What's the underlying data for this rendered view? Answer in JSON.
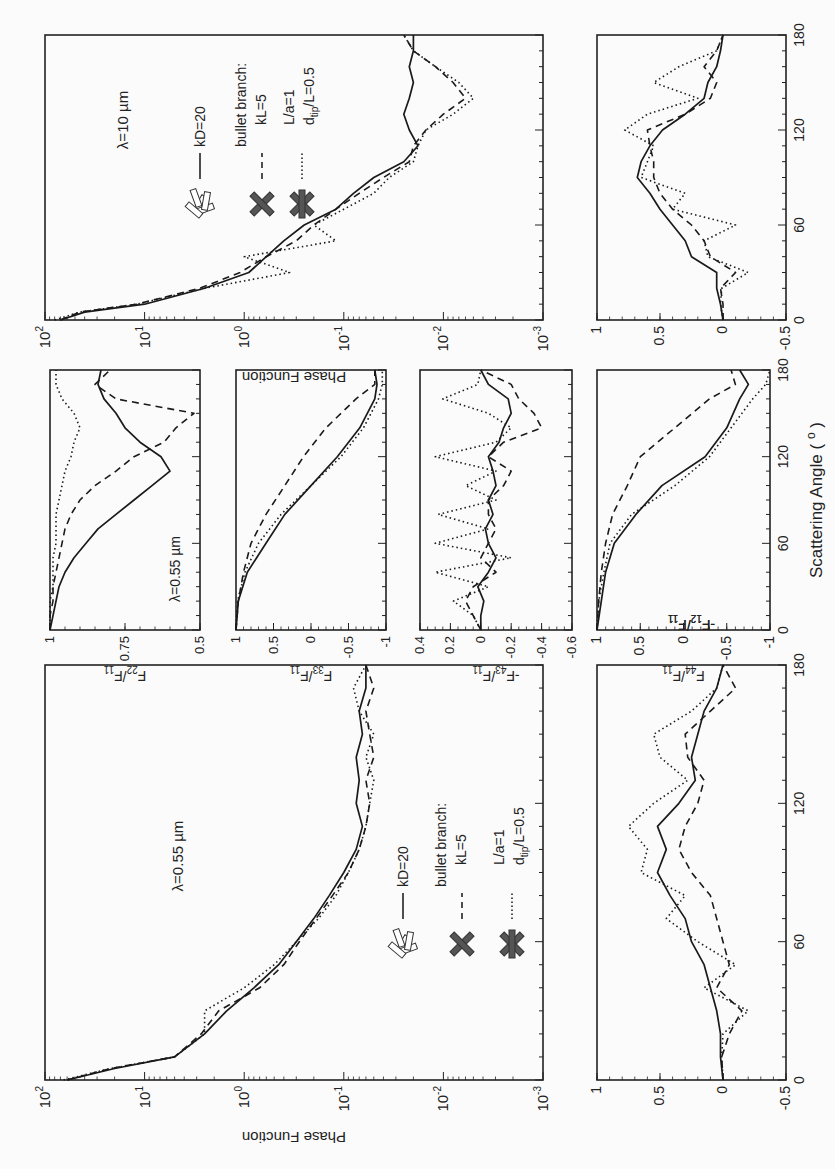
{
  "figure": {
    "orientation": "rotated-90-ccw",
    "x_axis_label": "Scattering Angle ( o )",
    "x_ticks": [
      "0",
      "60",
      "120",
      "180"
    ]
  },
  "panels": {
    "a_phase_10um": {
      "annotation": "λ=10 µm",
      "ylabel": "Phase Function",
      "yticks": [
        "10²",
        "10¹",
        "10⁰",
        "10⁻¹",
        "10⁻²",
        "10⁻³"
      ],
      "legend": {
        "solid": "kD=20",
        "header": "bullet branch:",
        "dashed": "kL=5",
        "dotted_1": "L/a=1",
        "dotted_2": "d_tip/L=0.5"
      }
    },
    "b_phase_055um": {
      "annotation": "λ=0.55 µm",
      "ylabel": "Phase Function",
      "yticks": [
        "10²",
        "10¹",
        "10⁰",
        "10⁻¹",
        "10⁻²",
        "10⁻³"
      ],
      "legend": {
        "solid": "kD=20",
        "header": "bullet branch:",
        "dashed": "kL=5",
        "dotted_1": "L/a=1",
        "dotted_2": "d_tip/L=0.5"
      }
    },
    "c_f12_10um": {
      "ylabel": "-F12/F11",
      "yticks": [
        "1",
        "0.5",
        "0",
        "-0.5"
      ]
    },
    "d_f12_055um": {
      "ylabel": "-F12/F11",
      "yticks": [
        "1",
        "0.5",
        "0",
        "-0.5"
      ]
    },
    "e_f22": {
      "annotation": "λ=0.55 µm",
      "ylabel": "F22/F11",
      "yticks": [
        "1",
        "0.75",
        "0.5"
      ]
    },
    "f_f33": {
      "ylabel": "F33/F11",
      "yticks": [
        "1",
        "0.5",
        "0",
        "-0.5",
        "-1"
      ]
    },
    "g_f43": {
      "ylabel": "-F43/F11",
      "yticks": [
        "0.4",
        "0.2",
        "0",
        "-0.2",
        "-0.4",
        "-0.6"
      ]
    },
    "h_f44": {
      "ylabel": "F44/F11",
      "yticks": [
        "1",
        "0.5",
        "0",
        "-0.5",
        "-1"
      ]
    }
  },
  "chart_data": [
    {
      "type": "line",
      "title": "Phase function, λ=10 µm",
      "xlabel": "Scattering Angle (°)",
      "ylabel": "Phase Function",
      "yscale": "log",
      "xlim": [
        0,
        180
      ],
      "ylim": [
        0.001,
        100
      ],
      "x": [
        0,
        5,
        10,
        20,
        30,
        40,
        50,
        60,
        70,
        80,
        90,
        100,
        110,
        120,
        130,
        140,
        150,
        160,
        170,
        180
      ],
      "series": [
        {
          "name": "kD=20 (aggregate)",
          "style": "solid",
          "values": [
            70,
            40,
            10,
            2.5,
            0.9,
            0.6,
            0.4,
            0.25,
            0.12,
            0.08,
            0.05,
            0.025,
            0.018,
            0.022,
            0.025,
            0.022,
            0.02,
            0.022,
            0.02,
            0.02
          ]
        },
        {
          "name": "bullet branch kL=5",
          "style": "dashed",
          "values": [
            70,
            45,
            12,
            2.8,
            1.1,
            0.6,
            0.3,
            0.2,
            0.12,
            0.07,
            0.04,
            0.022,
            0.02,
            0.015,
            0.01,
            0.006,
            0.008,
            0.012,
            0.02,
            0.025
          ]
        },
        {
          "name": "bullet branch L/a=1, d_tip/L=0.5",
          "style": "dotted",
          "values": [
            80,
            45,
            12,
            2.5,
            0.35,
            1.0,
            0.12,
            0.2,
            0.1,
            0.05,
            0.035,
            0.02,
            0.018,
            0.015,
            0.008,
            0.005,
            0.007,
            0.012,
            0.02,
            0.025
          ]
        }
      ]
    },
    {
      "type": "line",
      "title": "Phase function, λ=0.55 µm",
      "xlabel": "Scattering Angle (°)",
      "ylabel": "Phase Function",
      "yscale": "log",
      "xlim": [
        0,
        180
      ],
      "ylim": [
        0.001,
        100
      ],
      "x": [
        0,
        5,
        10,
        20,
        30,
        40,
        50,
        60,
        70,
        80,
        90,
        100,
        110,
        120,
        130,
        140,
        150,
        160,
        170,
        180
      ],
      "series": [
        {
          "name": "kD=20 (aggregate)",
          "style": "solid",
          "values": [
            60,
            20,
            5,
            2.5,
            1.5,
            0.8,
            0.45,
            0.3,
            0.2,
            0.14,
            0.1,
            0.075,
            0.065,
            0.075,
            0.07,
            0.075,
            0.065,
            0.07,
            0.06,
            0.06
          ]
        },
        {
          "name": "bullet branch kL=5",
          "style": "dashed",
          "values": [
            60,
            22,
            5,
            2.7,
            1.8,
            0.7,
            0.4,
            0.28,
            0.19,
            0.13,
            0.09,
            0.07,
            0.06,
            0.055,
            0.06,
            0.05,
            0.055,
            0.06,
            0.05,
            0.06
          ]
        },
        {
          "name": "bullet branch L/a=1, d_tip/L=0.5",
          "style": "dotted",
          "values": [
            65,
            22,
            5,
            2.5,
            2.5,
            1.0,
            0.5,
            0.3,
            0.18,
            0.12,
            0.09,
            0.07,
            0.06,
            0.055,
            0.05,
            0.06,
            0.05,
            0.07,
            0.08,
            0.06
          ]
        }
      ]
    },
    {
      "type": "line",
      "title": "-F12/F11, λ=10 µm",
      "xlabel": "Scattering Angle (°)",
      "ylabel": "-F12/F11",
      "xlim": [
        0,
        180
      ],
      "ylim": [
        -0.5,
        1
      ],
      "x": [
        0,
        10,
        20,
        30,
        40,
        50,
        60,
        70,
        80,
        90,
        100,
        110,
        120,
        130,
        140,
        150,
        160,
        170,
        180
      ],
      "series": [
        {
          "name": "kD=20",
          "style": "solid",
          "values": [
            0,
            0.02,
            0.05,
            0.05,
            0.25,
            0.3,
            0.4,
            0.5,
            0.58,
            0.68,
            0.65,
            0.58,
            0.48,
            0.3,
            0.15,
            0.12,
            0.05,
            0.02,
            0
          ]
        },
        {
          "name": "kL=5",
          "style": "dashed",
          "values": [
            0,
            0.0,
            0.02,
            -0.1,
            0.1,
            0.15,
            0.25,
            0.4,
            0.5,
            0.55,
            0.55,
            0.58,
            0.6,
            0.3,
            0.1,
            0.05,
            0.15,
            0.05,
            0
          ]
        },
        {
          "name": "L/a=1, d_tip/L=0.5",
          "style": "dotted",
          "values": [
            0,
            0.02,
            0.01,
            -0.2,
            0.12,
            0.15,
            -0.1,
            0.4,
            0.3,
            0.65,
            0.6,
            0.55,
            0.78,
            0.6,
            0.2,
            0.55,
            0.35,
            0.05,
            0
          ]
        }
      ]
    },
    {
      "type": "line",
      "title": "-F12/F11, λ=0.55 µm",
      "xlabel": "Scattering Angle (°)",
      "ylabel": "-F12/F11",
      "xlim": [
        0,
        180
      ],
      "ylim": [
        -0.5,
        1
      ],
      "x": [
        0,
        10,
        20,
        30,
        40,
        50,
        60,
        70,
        80,
        90,
        100,
        110,
        120,
        130,
        140,
        150,
        160,
        170,
        180
      ],
      "series": [
        {
          "name": "kD=20",
          "style": "solid",
          "values": [
            0,
            0.02,
            0.02,
            0.05,
            0.1,
            0.15,
            0.25,
            0.3,
            0.42,
            0.52,
            0.45,
            0.52,
            0.35,
            0.22,
            0.25,
            0.2,
            0.15,
            0.05,
            0
          ]
        },
        {
          "name": "kL=5",
          "style": "dashed",
          "values": [
            0,
            0.01,
            -0.05,
            -0.15,
            0.05,
            -0.05,
            0.0,
            0.05,
            0.1,
            0.25,
            0.35,
            0.3,
            0.2,
            0.15,
            0.28,
            0.3,
            0.1,
            -0.1,
            0
          ]
        },
        {
          "name": "L/a=1, d_tip/L=0.5",
          "style": "dotted",
          "values": [
            0,
            0.01,
            0.0,
            -0.2,
            0.15,
            -0.1,
            0.2,
            0.45,
            0.3,
            0.65,
            0.6,
            0.75,
            0.55,
            0.28,
            0.5,
            0.55,
            0.25,
            0.05,
            0
          ]
        }
      ]
    },
    {
      "type": "line",
      "title": "F22/F11, λ=0.55 µm",
      "xlabel": "Scattering Angle (°)",
      "ylabel": "F22/F11",
      "xlim": [
        0,
        180
      ],
      "ylim": [
        0.5,
        1
      ],
      "x": [
        0,
        10,
        20,
        30,
        40,
        50,
        60,
        70,
        80,
        90,
        100,
        110,
        120,
        130,
        140,
        150,
        160,
        170,
        180
      ],
      "series": [
        {
          "name": "kD=20",
          "style": "solid",
          "values": [
            1.0,
            0.99,
            0.98,
            0.97,
            0.95,
            0.92,
            0.88,
            0.84,
            0.78,
            0.72,
            0.66,
            0.6,
            0.63,
            0.7,
            0.75,
            0.78,
            0.82,
            0.84,
            0.83
          ]
        },
        {
          "name": "kL=5",
          "style": "dashed",
          "values": [
            1.0,
            1.0,
            0.99,
            0.99,
            0.98,
            0.97,
            0.96,
            0.95,
            0.93,
            0.9,
            0.85,
            0.78,
            0.72,
            0.62,
            0.58,
            0.52,
            0.78,
            0.85,
            0.8
          ]
        },
        {
          "name": "L/a=1, d_tip/L=0.5",
          "style": "dotted",
          "values": [
            1.0,
            1.0,
            1.0,
            0.99,
            0.99,
            0.99,
            0.98,
            0.98,
            0.98,
            0.97,
            0.96,
            0.95,
            0.93,
            0.92,
            0.9,
            0.92,
            0.96,
            0.98,
            0.98
          ]
        }
      ]
    },
    {
      "type": "line",
      "title": "F33/F11, λ=0.55 µm",
      "xlabel": "Scattering Angle (°)",
      "ylabel": "F33/F11",
      "xlim": [
        0,
        180
      ],
      "ylim": [
        -1,
        1
      ],
      "x": [
        0,
        20,
        40,
        60,
        80,
        100,
        120,
        140,
        160,
        170,
        180
      ],
      "series": [
        {
          "name": "kD=20",
          "style": "solid",
          "values": [
            1.0,
            0.97,
            0.85,
            0.6,
            0.35,
            0.0,
            -0.35,
            -0.65,
            -0.85,
            -0.88,
            -0.85
          ]
        },
        {
          "name": "kL=5",
          "style": "dashed",
          "values": [
            1.0,
            0.97,
            0.9,
            0.8,
            0.6,
            0.35,
            0.1,
            -0.2,
            -0.6,
            -0.85,
            -0.85
          ]
        },
        {
          "name": "L/a=1, d_tip/L=0.5",
          "style": "dotted",
          "values": [
            1.0,
            0.98,
            0.88,
            0.7,
            0.4,
            0.0,
            -0.4,
            -0.7,
            -0.9,
            -0.95,
            -0.95
          ]
        }
      ]
    },
    {
      "type": "line",
      "title": "-F43/F11, λ=0.55 µm",
      "xlabel": "Scattering Angle (°)",
      "ylabel": "-F43/F11",
      "xlim": [
        0,
        180
      ],
      "ylim": [
        -0.6,
        0.4
      ],
      "x": [
        0,
        10,
        20,
        30,
        40,
        50,
        60,
        70,
        80,
        90,
        100,
        110,
        120,
        130,
        140,
        150,
        160,
        170,
        180
      ],
      "series": [
        {
          "name": "kD=20",
          "style": "solid",
          "values": [
            0,
            0,
            -0.02,
            0.02,
            -0.05,
            -0.1,
            -0.05,
            -0.03,
            -0.08,
            -0.05,
            -0.1,
            -0.08,
            -0.05,
            -0.12,
            -0.15,
            -0.2,
            -0.18,
            -0.05,
            0
          ]
        },
        {
          "name": "kL=5",
          "style": "dashed",
          "values": [
            0,
            0.05,
            0.1,
            0.05,
            -0.1,
            0.0,
            -0.05,
            -0.1,
            -0.05,
            -0.05,
            -0.15,
            -0.2,
            -0.05,
            -0.15,
            -0.4,
            -0.35,
            -0.25,
            -0.2,
            0
          ]
        },
        {
          "name": "L/a=1, d_tip/L=0.5",
          "style": "dotted",
          "values": [
            0,
            0.05,
            0.18,
            -0.05,
            0.3,
            -0.2,
            0.3,
            -0.05,
            0.28,
            -0.1,
            0.1,
            -0.1,
            0.3,
            -0.1,
            -0.2,
            -0.05,
            0.25,
            0.02,
            0
          ]
        }
      ]
    },
    {
      "type": "line",
      "title": "F44/F11, λ=0.55 µm",
      "xlabel": "Scattering Angle (°)",
      "ylabel": "F44/F11",
      "xlim": [
        0,
        180
      ],
      "ylim": [
        -1,
        1
      ],
      "x": [
        0,
        20,
        40,
        60,
        80,
        100,
        120,
        140,
        160,
        170,
        180
      ],
      "series": [
        {
          "name": "kD=20",
          "style": "solid",
          "values": [
            1.0,
            0.95,
            0.9,
            0.8,
            0.55,
            0.25,
            -0.25,
            -0.5,
            -0.65,
            -0.75,
            -0.65
          ]
        },
        {
          "name": "kL=5",
          "style": "dashed",
          "values": [
            1.0,
            0.98,
            0.95,
            0.9,
            0.82,
            0.65,
            0.5,
            0.1,
            -0.3,
            -0.6,
            -0.55
          ]
        },
        {
          "name": "L/a=1, d_tip/L=0.5",
          "style": "dotted",
          "values": [
            1.0,
            0.98,
            0.92,
            0.85,
            0.6,
            0.1,
            -0.3,
            -0.55,
            -0.8,
            -0.95,
            -1.0
          ]
        }
      ]
    }
  ]
}
